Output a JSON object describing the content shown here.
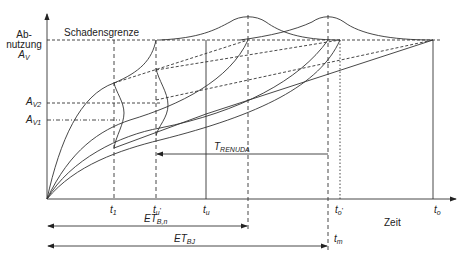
{
  "diagram": {
    "y_axis_label_line1": "Ab-",
    "y_axis_label_line2": "nutzung",
    "y_axis_symbol": "A",
    "y_axis_symbol_sub": "V",
    "x_axis_label": "Zeit",
    "damage_limit_label": "Schadensgrenze",
    "levels": [
      {
        "symbol": "A",
        "sub": "V2"
      },
      {
        "symbol": "A",
        "sub": "V1"
      }
    ],
    "time_marks": [
      {
        "symbol": "t",
        "sub": "1",
        "prime": ""
      },
      {
        "symbol": "t",
        "sub": "u",
        "prime": "'"
      },
      {
        "symbol": "t",
        "sub": "u",
        "prime": ""
      },
      {
        "symbol": "t",
        "sub": "o",
        "prime": "'"
      },
      {
        "symbol": "t",
        "sub": "o",
        "prime": ""
      },
      {
        "symbol": "t",
        "sub": "m",
        "prime": ""
      }
    ],
    "intervals": [
      {
        "symbol": "T",
        "sub": "RENUDA"
      },
      {
        "symbol": "ET",
        "sub": "B,n"
      },
      {
        "symbol": "ET",
        "sub": "BJ"
      }
    ],
    "colors": {
      "line": "#333333",
      "background": "#ffffff"
    }
  }
}
